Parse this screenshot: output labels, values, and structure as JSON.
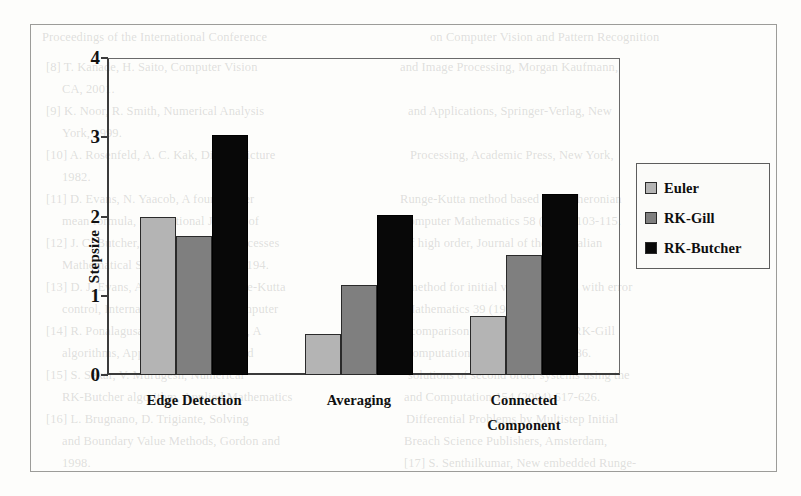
{
  "chart_data": {
    "type": "bar",
    "title": "",
    "subtitle": "",
    "xlabel": "",
    "ylabel": "Stepsize",
    "categories": [
      "Edge Detection",
      "Averaging",
      "Connected Component"
    ],
    "category_lines": [
      [
        "Edge Detection"
      ],
      [
        "Averaging"
      ],
      [
        "Connected",
        "Component"
      ]
    ],
    "series": [
      {
        "name": "Euler",
        "color": "#b4b4b4",
        "values": [
          2.0,
          0.52,
          0.74
        ]
      },
      {
        "name": "RK-Gill",
        "color": "#7f7f7f",
        "values": [
          1.75,
          1.13,
          1.51
        ]
      },
      {
        "name": "RK-Butcher",
        "color": "#080808",
        "values": [
          3.03,
          2.02,
          2.28
        ]
      }
    ],
    "ylim": [
      0,
      4
    ],
    "yticks": [
      0,
      1,
      2,
      3,
      4
    ],
    "ytick_labels": [
      "0",
      "1",
      "2",
      "3",
      "4"
    ],
    "grid": false,
    "legend_position": "right"
  },
  "legend": {
    "items": [
      {
        "label": "Euler",
        "swatch": "legend-swatch-euler"
      },
      {
        "label": "RK-Gill",
        "swatch": "legend-swatch-rk-gill"
      },
      {
        "label": "RK-Butcher",
        "swatch": "legend-swatch-rk-butcher"
      }
    ]
  },
  "background_text": [
    {
      "text": "Proceedings of the International Conference",
      "x": 42,
      "y": 30
    },
    {
      "text": "on Computer Vision and Pattern Recognition",
      "x": 430,
      "y": 30
    },
    {
      "text": "[8] T. Kanade, H. Saito, Computer Vision",
      "x": 46,
      "y": 60
    },
    {
      "text": "and Image Processing, Morgan Kaufmann,",
      "x": 400,
      "y": 60
    },
    {
      "text": "CA, 2001.",
      "x": 62,
      "y": 82
    },
    {
      "text": "[9] K. Noor, R. Smith, Numerical Analysis",
      "x": 46,
      "y": 104
    },
    {
      "text": "and Applications, Springer-Verlag, New",
      "x": 408,
      "y": 104
    },
    {
      "text": "York, 1999.",
      "x": 62,
      "y": 126
    },
    {
      "text": "[10] A. Rosenfeld, A. C. Kak, Digital Picture",
      "x": 46,
      "y": 148
    },
    {
      "text": "Processing, Academic Press, New York,",
      "x": 410,
      "y": 148
    },
    {
      "text": "1982.",
      "x": 62,
      "y": 170
    },
    {
      "text": "[11] D. Evans, N. Yaacob, A fourth order",
      "x": 46,
      "y": 192
    },
    {
      "text": "Runge-Kutta method based on the heronian",
      "x": 400,
      "y": 192
    },
    {
      "text": "mean formula, International Journal of",
      "x": 62,
      "y": 214
    },
    {
      "text": "Computer Mathematics 58 (1995) 103-115.",
      "x": 400,
      "y": 214
    },
    {
      "text": "[12] J. C. Butcher, On Runge-Kutta processes",
      "x": 46,
      "y": 236
    },
    {
      "text": "of high order, Journal of the Australian",
      "x": 404,
      "y": 236
    },
    {
      "text": "Mathematical Society 4 (1964) 179-194.",
      "x": 62,
      "y": 258
    },
    {
      "text": "[13] D. J. Evans, A new 4th order Runge-Kutta",
      "x": 46,
      "y": 280
    },
    {
      "text": "method for initial value problems with error",
      "x": 408,
      "y": 280
    },
    {
      "text": "control, International Journal of Computer",
      "x": 62,
      "y": 302
    },
    {
      "text": "Mathematics 39 (1991) 217-227.",
      "x": 404,
      "y": 302
    },
    {
      "text": "[14] R. Ponalagusamy, S. Senthilkumar, A",
      "x": 46,
      "y": 324
    },
    {
      "text": "comparison of RK-Butcher and RK-Gill",
      "x": 410,
      "y": 324
    },
    {
      "text": "algorithms, Applied Mathematics and",
      "x": 62,
      "y": 346
    },
    {
      "text": "Computation 182 (2006) 1379-1386.",
      "x": 404,
      "y": 346
    },
    {
      "text": "[15] S. Sekar, V. Murugesh, Numerical",
      "x": 46,
      "y": 368
    },
    {
      "text": "solutions of second order systems using the",
      "x": 408,
      "y": 368
    },
    {
      "text": "RK-Butcher algorithm, Applied Mathematics",
      "x": 62,
      "y": 390
    },
    {
      "text": "and Computation 154 (2004) 617-626.",
      "x": 404,
      "y": 390
    },
    {
      "text": "[16] L. Brugnano, D. Trigiante, Solving",
      "x": 46,
      "y": 412
    },
    {
      "text": "Differential Problems by Multistep Initial",
      "x": 406,
      "y": 412
    },
    {
      "text": "and Boundary Value Methods, Gordon and",
      "x": 62,
      "y": 434
    },
    {
      "text": "Breach Science Publishers, Amsterdam,",
      "x": 404,
      "y": 434
    },
    {
      "text": "1998.",
      "x": 62,
      "y": 456
    },
    {
      "text": "[17] S. Senthilkumar, New embedded Runge-",
      "x": 404,
      "y": 456
    }
  ]
}
